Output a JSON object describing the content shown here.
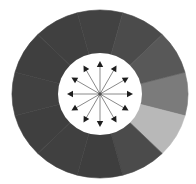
{
  "diagram": {
    "type": "radial-donut-with-arrows",
    "center": {
      "x": 100,
      "y": 94
    },
    "outer_radius": {
      "rx": 88,
      "ry": 84
    },
    "inner_radius": 41,
    "hub_color": "#ffffff",
    "arrow_color": "#8a8a8a",
    "arrowhead_color": "#1e1e1e",
    "arrow_count": 12,
    "arrow_length": 33,
    "segments": [
      {
        "start": -15,
        "end": 15,
        "color": "#7b7b7b"
      },
      {
        "start": 15,
        "end": 45,
        "color": "#b8b8b8"
      },
      {
        "start": 45,
        "end": 75,
        "color": "#4b4b4b"
      },
      {
        "start": 75,
        "end": 105,
        "color": "#3e3e3e"
      },
      {
        "start": 105,
        "end": 135,
        "color": "#404040"
      },
      {
        "start": 135,
        "end": 165,
        "color": "#3f3f3f"
      },
      {
        "start": 165,
        "end": 195,
        "color": "#414141"
      },
      {
        "start": 195,
        "end": 225,
        "color": "#3f3f3f"
      },
      {
        "start": 225,
        "end": 255,
        "color": "#404040"
      },
      {
        "start": 255,
        "end": 285,
        "color": "#424242"
      },
      {
        "start": 285,
        "end": 315,
        "color": "#4b4b4b"
      },
      {
        "start": 315,
        "end": 345,
        "color": "#585858"
      }
    ]
  }
}
